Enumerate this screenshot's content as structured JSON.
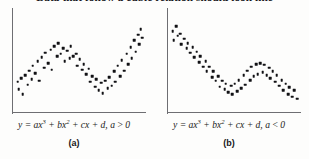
{
  "heading": "Data that follow a cubic relation should look like",
  "panels": [
    {
      "id": "panel-a",
      "equation_prefix": "y = ax",
      "equation_exp1": "3",
      "equation_mid1": " + bx",
      "equation_exp2": "2",
      "equation_mid2": " + cx + d, a ",
      "equation_rel": ">",
      "equation_suffix": " 0",
      "equation_plain": "y = ax3 + bx2 + cx + d, a > 0",
      "sublabel": "(a)"
    },
    {
      "id": "panel-b",
      "equation_prefix": "y = ax",
      "equation_exp1": "3",
      "equation_mid1": " + bx",
      "equation_exp2": "2",
      "equation_mid2": " + cx + d, a ",
      "equation_rel": "<",
      "equation_suffix": " 0",
      "equation_plain": "y = ax3 + bx2 + cx + d, a < 0",
      "sublabel": "(b)"
    }
  ],
  "colors": {
    "dot": "#111114",
    "axis": "#6e6e72",
    "background": "#fdfdfc",
    "text": "#17171b"
  },
  "chart_data": [
    {
      "type": "scatter",
      "title": "y = ax3 + bx2 + cx + d, a > 0",
      "subtitle": "(a)",
      "xlabel": "",
      "ylabel": "",
      "xlim": [
        0,
        100
      ],
      "ylim": [
        0,
        100
      ],
      "grid": false,
      "legend": "none",
      "description": "Scatter of data following an increasing cubic: rises to a local maximum near x=33, dips to a local minimum near x=60, then rises steeply.",
      "points": [
        [
          2,
          30
        ],
        [
          3,
          22
        ],
        [
          5,
          34
        ],
        [
          6,
          17
        ],
        [
          8,
          37
        ],
        [
          10,
          27
        ],
        [
          11,
          42
        ],
        [
          13,
          33
        ],
        [
          14,
          47
        ],
        [
          16,
          39
        ],
        [
          18,
          52
        ],
        [
          19,
          31
        ],
        [
          21,
          56
        ],
        [
          23,
          45
        ],
        [
          24,
          61
        ],
        [
          26,
          50
        ],
        [
          28,
          64
        ],
        [
          29,
          43
        ],
        [
          31,
          68
        ],
        [
          33,
          57
        ],
        [
          34,
          71
        ],
        [
          36,
          60
        ],
        [
          38,
          66
        ],
        [
          39,
          52
        ],
        [
          41,
          63
        ],
        [
          43,
          55
        ],
        [
          44,
          68
        ],
        [
          46,
          57
        ],
        [
          48,
          60
        ],
        [
          49,
          47
        ],
        [
          51,
          54
        ],
        [
          53,
          43
        ],
        [
          54,
          49
        ],
        [
          56,
          38
        ],
        [
          58,
          44
        ],
        [
          59,
          30
        ],
        [
          61,
          36
        ],
        [
          63,
          25
        ],
        [
          64,
          33
        ],
        [
          66,
          21
        ],
        [
          68,
          29
        ],
        [
          69,
          18
        ],
        [
          71,
          31
        ],
        [
          73,
          23
        ],
        [
          74,
          35
        ],
        [
          76,
          26
        ],
        [
          78,
          41
        ],
        [
          79,
          30
        ],
        [
          81,
          47
        ],
        [
          83,
          36
        ],
        [
          84,
          53
        ],
        [
          86,
          42
        ],
        [
          88,
          60
        ],
        [
          89,
          49
        ],
        [
          91,
          67
        ],
        [
          92,
          55
        ],
        [
          94,
          74
        ],
        [
          95,
          62
        ],
        [
          97,
          80
        ],
        [
          98,
          70
        ],
        [
          99,
          86
        ],
        [
          100,
          77
        ]
      ]
    },
    {
      "type": "scatter",
      "title": "y = ax3 + bx2 + cx + d, a < 0",
      "subtitle": "(b)",
      "xlabel": "",
      "ylabel": "",
      "xlim": [
        0,
        100
      ],
      "ylim": [
        0,
        100
      ],
      "grid": false,
      "legend": "none",
      "description": "Scatter of data following a decreasing cubic: starts high, falls to a local minimum near x=40, rises to a local maximum near x=68, then falls again.",
      "points": [
        [
          2,
          84
        ],
        [
          3,
          74
        ],
        [
          5,
          89
        ],
        [
          6,
          79
        ],
        [
          8,
          81
        ],
        [
          9,
          70
        ],
        [
          11,
          76
        ],
        [
          13,
          66
        ],
        [
          14,
          71
        ],
        [
          16,
          61
        ],
        [
          18,
          67
        ],
        [
          19,
          56
        ],
        [
          21,
          62
        ],
        [
          23,
          51
        ],
        [
          24,
          57
        ],
        [
          26,
          46
        ],
        [
          28,
          52
        ],
        [
          29,
          41
        ],
        [
          31,
          46
        ],
        [
          33,
          35
        ],
        [
          34,
          41
        ],
        [
          36,
          31
        ],
        [
          38,
          36
        ],
        [
          39,
          25
        ],
        [
          41,
          31
        ],
        [
          43,
          22
        ],
        [
          44,
          28
        ],
        [
          46,
          19
        ],
        [
          48,
          26
        ],
        [
          49,
          17
        ],
        [
          51,
          28
        ],
        [
          53,
          20
        ],
        [
          54,
          32
        ],
        [
          56,
          23
        ],
        [
          58,
          37
        ],
        [
          59,
          27
        ],
        [
          61,
          42
        ],
        [
          63,
          32
        ],
        [
          64,
          46
        ],
        [
          66,
          36
        ],
        [
          68,
          49
        ],
        [
          69,
          38
        ],
        [
          71,
          50
        ],
        [
          73,
          40
        ],
        [
          74,
          48
        ],
        [
          76,
          37
        ],
        [
          78,
          45
        ],
        [
          79,
          34
        ],
        [
          81,
          41
        ],
        [
          83,
          30
        ],
        [
          84,
          37
        ],
        [
          86,
          26
        ],
        [
          88,
          32
        ],
        [
          89,
          21
        ],
        [
          91,
          28
        ],
        [
          93,
          17
        ],
        [
          94,
          24
        ],
        [
          96,
          14
        ],
        [
          98,
          21
        ],
        [
          100,
          12
        ]
      ]
    }
  ]
}
